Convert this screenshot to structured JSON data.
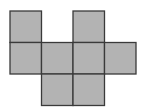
{
  "diagram": {
    "type": "polyomino-net",
    "cell_count": 8,
    "grid": {
      "origin_x": 10,
      "origin_y": 11,
      "cell_size": 31.5,
      "rows": 3,
      "cols": 4
    },
    "colors": {
      "fill": "#b3b3b3",
      "stroke": "#3a3a3a",
      "background": "#ffffff"
    },
    "cells": [
      {
        "row": 0,
        "col": 0
      },
      {
        "row": 0,
        "col": 2
      },
      {
        "row": 1,
        "col": 0
      },
      {
        "row": 1,
        "col": 1
      },
      {
        "row": 1,
        "col": 2
      },
      {
        "row": 1,
        "col": 3
      },
      {
        "row": 2,
        "col": 1
      },
      {
        "row": 2,
        "col": 2
      }
    ]
  }
}
